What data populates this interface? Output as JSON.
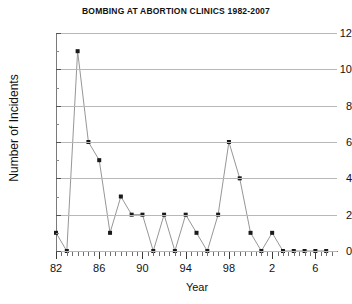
{
  "chart_data": {
    "type": "line",
    "title": "BOMBING AT ABORTION CLINICS 1982-2007",
    "xlabel": "Year",
    "ylabel": "Number of Incidents",
    "x": [
      1982,
      1983,
      1984,
      1985,
      1986,
      1987,
      1988,
      1989,
      1990,
      1991,
      1992,
      1993,
      1994,
      1995,
      1996,
      1997,
      1998,
      1999,
      2000,
      2001,
      2002,
      2003,
      2004,
      2005,
      2006,
      2007
    ],
    "values": [
      1,
      0,
      11,
      6,
      5,
      1,
      3,
      2,
      2,
      0,
      2,
      0,
      2,
      1,
      0,
      2,
      6,
      4,
      1,
      0,
      1,
      0,
      0,
      0,
      0,
      0
    ],
    "categories": [
      "1982",
      "1983",
      "1984",
      "1985",
      "1986",
      "1987",
      "1988",
      "1989",
      "1990",
      "1991",
      "1992",
      "1993",
      "1994",
      "1995",
      "1996",
      "1997",
      "1998",
      "1999",
      "2000",
      "2001",
      "2002",
      "2003",
      "2004",
      "2005",
      "2006",
      "2007"
    ],
    "xlim": [
      1982,
      2008
    ],
    "ylim": [
      0,
      12
    ],
    "ytick_values": [
      0,
      2,
      4,
      6,
      8,
      10,
      12
    ],
    "ytick_labels": [
      "0",
      "2",
      "4",
      "6",
      "8",
      "10",
      "12"
    ],
    "xtick_values": [
      1982,
      1986,
      1990,
      1994,
      1998,
      2002,
      2006
    ],
    "xtick_labels": [
      "82",
      "86",
      "90",
      "94",
      "98",
      "2",
      "6"
    ],
    "xtick_minor_step": 0.5,
    "grid": "horizontal",
    "legend": "none",
    "marker": "square",
    "marker_color": "#1a1a1a",
    "line_color": "#8a8a8a",
    "grid_color": "#b8b8b8",
    "axis_color": "#7a7a7a",
    "background": "#ffffff"
  }
}
